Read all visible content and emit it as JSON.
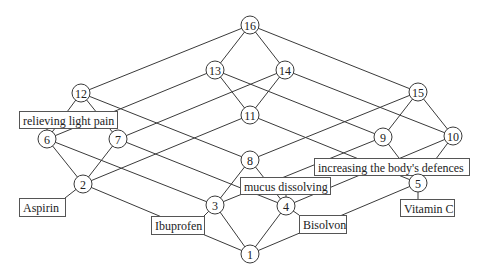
{
  "diagram": {
    "type": "concept-lattice",
    "nodes": [
      {
        "id": "1",
        "label": "1",
        "x": 250,
        "y": 254
      },
      {
        "id": "2",
        "label": "2",
        "x": 83,
        "y": 184
      },
      {
        "id": "3",
        "label": "3",
        "x": 215,
        "y": 205
      },
      {
        "id": "4",
        "label": "4",
        "x": 286,
        "y": 206
      },
      {
        "id": "5",
        "label": "5",
        "x": 418,
        "y": 183
      },
      {
        "id": "6",
        "label": "6",
        "x": 47,
        "y": 139
      },
      {
        "id": "7",
        "label": "7",
        "x": 118,
        "y": 139
      },
      {
        "id": "8",
        "label": "8",
        "x": 250,
        "y": 160
      },
      {
        "id": "9",
        "label": "9",
        "x": 383,
        "y": 137
      },
      {
        "id": "10",
        "label": "10",
        "x": 453,
        "y": 136
      },
      {
        "id": "11",
        "label": "11",
        "x": 250,
        "y": 115
      },
      {
        "id": "12",
        "label": "12",
        "x": 81,
        "y": 93
      },
      {
        "id": "13",
        "label": "13",
        "x": 215,
        "y": 70
      },
      {
        "id": "14",
        "label": "14",
        "x": 285,
        "y": 70
      },
      {
        "id": "15",
        "label": "15",
        "x": 418,
        "y": 92
      },
      {
        "id": "16",
        "label": "16",
        "x": 250,
        "y": 25
      }
    ],
    "edges": [
      [
        "1",
        "2"
      ],
      [
        "1",
        "3"
      ],
      [
        "1",
        "4"
      ],
      [
        "1",
        "5"
      ],
      [
        "2",
        "6"
      ],
      [
        "2",
        "7"
      ],
      [
        "2",
        "11"
      ],
      [
        "3",
        "6"
      ],
      [
        "3",
        "8"
      ],
      [
        "3",
        "9"
      ],
      [
        "4",
        "7"
      ],
      [
        "4",
        "8"
      ],
      [
        "4",
        "10"
      ],
      [
        "5",
        "11"
      ],
      [
        "5",
        "9"
      ],
      [
        "5",
        "10"
      ],
      [
        "6",
        "12"
      ],
      [
        "6",
        "13"
      ],
      [
        "7",
        "12"
      ],
      [
        "7",
        "14"
      ],
      [
        "8",
        "12"
      ],
      [
        "8",
        "15"
      ],
      [
        "11",
        "13"
      ],
      [
        "11",
        "14"
      ],
      [
        "9",
        "13"
      ],
      [
        "9",
        "15"
      ],
      [
        "10",
        "14"
      ],
      [
        "10",
        "15"
      ],
      [
        "12",
        "16"
      ],
      [
        "13",
        "16"
      ],
      [
        "14",
        "16"
      ],
      [
        "15",
        "16"
      ]
    ],
    "labels": [
      {
        "id": "relieving-light-pain",
        "text": "relieving light pain",
        "attached_to": "6",
        "box": {
          "x": 19,
          "y": 111,
          "w": 98,
          "h": 17
        }
      },
      {
        "id": "mucus-dissolving",
        "text": "mucus dissolving",
        "attached_to": "4",
        "box": {
          "x": 240,
          "y": 177,
          "w": 90,
          "h": 17
        }
      },
      {
        "id": "increasing-defences",
        "text": "increasing the body's defences",
        "attached_to": "5",
        "box": {
          "x": 314,
          "y": 158,
          "w": 155,
          "h": 17
        }
      },
      {
        "id": "aspirin",
        "text": "Aspirin",
        "attached_to": "2",
        "box": {
          "x": 19,
          "y": 198,
          "w": 46,
          "h": 18
        }
      },
      {
        "id": "ibuprofen",
        "text": "Ibuprofen",
        "attached_to": "3",
        "box": {
          "x": 151,
          "y": 216,
          "w": 53,
          "h": 18
        }
      },
      {
        "id": "bisolvon",
        "text": "Bisolvon",
        "attached_to": "4",
        "box": {
          "x": 299,
          "y": 215,
          "w": 47,
          "h": 18
        }
      },
      {
        "id": "vitamin-c",
        "text": "Vitamin C",
        "attached_to": "5",
        "box": {
          "x": 400,
          "y": 199,
          "w": 54,
          "h": 17
        }
      }
    ],
    "node_radius": 9,
    "colors": {
      "stroke": "#3a3a3a",
      "fill": "#ffffff",
      "text": "#222222"
    }
  }
}
